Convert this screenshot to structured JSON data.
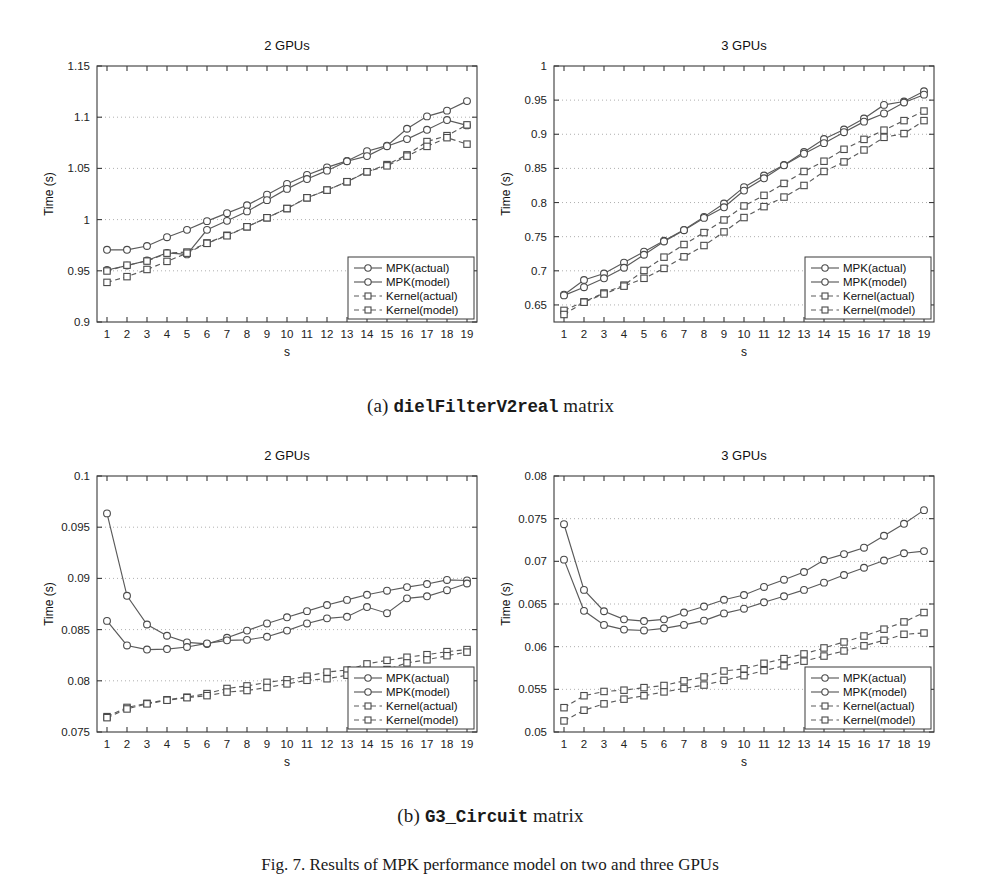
{
  "figure": {
    "caption_a_prefix": "(a) ",
    "caption_a_mono": "dielFilterV2real",
    "caption_a_suffix": " matrix",
    "caption_b_prefix": "(b) ",
    "caption_b_mono": "G3_Circuit",
    "caption_b_suffix": " matrix",
    "figure_caption": "Fig. 7. Results of MPK performance model on two and three GPUs"
  },
  "legend": {
    "entries": [
      {
        "label": "MPK(actual)",
        "marker": "circle",
        "dash": false
      },
      {
        "label": "MPK(model)",
        "marker": "circle",
        "dash": false
      },
      {
        "label": "Kernel(actual)",
        "marker": "square",
        "dash": true
      },
      {
        "label": "Kernel(model)",
        "marker": "square",
        "dash": true
      }
    ]
  },
  "chart_data": [
    {
      "id": "diel-2gpu",
      "type": "line",
      "title": "2 GPUs",
      "xlabel": "s",
      "ylabel": "Time (s)",
      "xlim": [
        0.5,
        19.5
      ],
      "ylim": [
        0.9,
        1.15
      ],
      "yticks": [
        0.9,
        0.95,
        1,
        1.05,
        1.1,
        1.15
      ],
      "yticklabels": [
        "0.9",
        "0.95",
        "1",
        "1.05",
        "1.1",
        "1.15"
      ],
      "x": [
        1,
        2,
        3,
        4,
        5,
        6,
        7,
        8,
        9,
        10,
        11,
        12,
        13,
        14,
        15,
        16,
        17,
        18,
        19
      ],
      "xticklabels": [
        "1",
        "2",
        "3",
        "4",
        "5",
        "6",
        "7",
        "8",
        "9",
        "10",
        "11",
        "12",
        "13",
        "14",
        "15",
        "16",
        "17",
        "18",
        "19"
      ],
      "grid": true,
      "legend_position": "lower-right",
      "series": [
        {
          "name": "MPK(actual)",
          "marker": "circle",
          "dash": false,
          "values": [
            0.9705,
            0.9705,
            0.9742,
            0.9828,
            0.99,
            0.9985,
            1.0063,
            1.014,
            1.0243,
            1.0348,
            1.0436,
            1.051,
            1.0573,
            1.0668,
            1.0722,
            1.0887,
            1.1008,
            1.1064,
            1.1157
          ]
        },
        {
          "name": "MPK(model)",
          "marker": "circle",
          "dash": false,
          "values": [
            0.9508,
            0.9551,
            0.96,
            0.9675,
            0.966,
            0.99,
            0.9988,
            1.008,
            1.019,
            1.03,
            1.0396,
            1.0478,
            1.057,
            1.062,
            1.0717,
            1.0786,
            1.0877,
            1.0972,
            1.092
          ]
        },
        {
          "name": "Kernel(actual)",
          "marker": "square",
          "dash": true,
          "values": [
            0.9498,
            0.9555,
            0.9595,
            0.9672,
            0.9683,
            0.9772,
            0.9847,
            0.993,
            1.0018,
            1.0108,
            1.0213,
            1.0288,
            1.037,
            1.0467,
            1.0537,
            1.0632,
            1.0762,
            1.082,
            1.0925
          ]
        },
        {
          "name": "Kernel(model)",
          "marker": "square",
          "dash": true,
          "values": [
            0.9387,
            0.9443,
            0.9513,
            0.9592,
            0.9672,
            0.9768,
            0.9842,
            0.993,
            1.0018,
            1.0108,
            1.0213,
            1.0288,
            1.037,
            1.0467,
            1.0525,
            1.062,
            1.0715,
            1.08,
            1.0737
          ]
        }
      ]
    },
    {
      "id": "diel-3gpu",
      "type": "line",
      "title": "3 GPUs",
      "xlabel": "s",
      "ylabel": "Time (s)",
      "xlim": [
        0.5,
        19.5
      ],
      "ylim": [
        0.625,
        1.0
      ],
      "yticks": [
        0.65,
        0.7,
        0.75,
        0.8,
        0.85,
        0.9,
        0.95,
        1
      ],
      "yticklabels": [
        "0.65",
        "0.7",
        "0.75",
        "0.8",
        "0.85",
        "0.9",
        "0.95",
        "1"
      ],
      "x": [
        1,
        2,
        3,
        4,
        5,
        6,
        7,
        8,
        9,
        10,
        11,
        12,
        13,
        14,
        15,
        16,
        17,
        18,
        19
      ],
      "xticklabels": [
        "1",
        "2",
        "3",
        "4",
        "5",
        "6",
        "7",
        "8",
        "9",
        "10",
        "11",
        "12",
        "13",
        "14",
        "15",
        "16",
        "17",
        "18",
        "19"
      ],
      "grid": true,
      "legend_position": "lower-right",
      "series": [
        {
          "name": "MPK(actual)",
          "marker": "circle",
          "dash": false,
          "values": [
            0.665,
            0.6865,
            0.696,
            0.712,
            0.728,
            0.744,
            0.76,
            0.779,
            0.7985,
            0.8225,
            0.8395,
            0.855,
            0.874,
            0.893,
            0.907,
            0.923,
            0.943,
            0.948,
            0.963
          ]
        },
        {
          "name": "MPK(model)",
          "marker": "circle",
          "dash": false,
          "values": [
            0.664,
            0.676,
            0.689,
            0.7045,
            0.7235,
            0.743,
            0.7595,
            0.7775,
            0.793,
            0.8175,
            0.8355,
            0.8545,
            0.8715,
            0.887,
            0.903,
            0.9185,
            0.9305,
            0.9465,
            0.958
          ]
        },
        {
          "name": "Kernel(actual)",
          "marker": "square",
          "dash": true,
          "values": [
            0.642,
            0.6545,
            0.6675,
            0.679,
            0.7005,
            0.72,
            0.7385,
            0.756,
            0.7745,
            0.795,
            0.8105,
            0.828,
            0.8455,
            0.8605,
            0.878,
            0.8925,
            0.906,
            0.92,
            0.934
          ]
        },
        {
          "name": "Kernel(model)",
          "marker": "square",
          "dash": true,
          "values": [
            0.636,
            0.654,
            0.666,
            0.6775,
            0.689,
            0.7035,
            0.7205,
            0.737,
            0.757,
            0.778,
            0.794,
            0.808,
            0.825,
            0.8455,
            0.8595,
            0.877,
            0.8955,
            0.901,
            0.92
          ]
        }
      ]
    },
    {
      "id": "g3-2gpu",
      "type": "line",
      "title": "2 GPUs",
      "xlabel": "s",
      "ylabel": "Time (s)",
      "xlim": [
        0.5,
        19.5
      ],
      "ylim": [
        0.075,
        0.1
      ],
      "yticks": [
        0.075,
        0.08,
        0.085,
        0.09,
        0.095,
        0.1
      ],
      "yticklabels": [
        "0.075",
        "0.08",
        "0.085",
        "0.09",
        "0.095",
        "0.1"
      ],
      "x": [
        1,
        2,
        3,
        4,
        5,
        6,
        7,
        8,
        9,
        10,
        11,
        12,
        13,
        14,
        15,
        16,
        17,
        18,
        19
      ],
      "xticklabels": [
        "1",
        "2",
        "3",
        "4",
        "5",
        "6",
        "7",
        "8",
        "9",
        "10",
        "11",
        "12",
        "13",
        "14",
        "15",
        "16",
        "17",
        "18",
        "19"
      ],
      "grid": true,
      "legend_position": "lower-right",
      "series": [
        {
          "name": "MPK(actual)",
          "marker": "circle",
          "dash": false,
          "values": [
            0.09635,
            0.0883,
            0.0855,
            0.0844,
            0.08375,
            0.0836,
            0.0842,
            0.0849,
            0.0856,
            0.0862,
            0.0868,
            0.0874,
            0.0879,
            0.0884,
            0.0888,
            0.08915,
            0.08945,
            0.08985,
            0.0898
          ]
        },
        {
          "name": "MPK(model)",
          "marker": "circle",
          "dash": false,
          "values": [
            0.08585,
            0.08345,
            0.08305,
            0.0831,
            0.0833,
            0.08365,
            0.08395,
            0.084,
            0.0843,
            0.0849,
            0.0856,
            0.0861,
            0.08625,
            0.0872,
            0.0866,
            0.08805,
            0.08825,
            0.08885,
            0.0895
          ]
        },
        {
          "name": "Kernel(actual)",
          "marker": "square",
          "dash": true,
          "values": [
            0.0765,
            0.0774,
            0.0778,
            0.07815,
            0.0784,
            0.07875,
            0.07925,
            0.0795,
            0.07985,
            0.0801,
            0.08045,
            0.08085,
            0.08105,
            0.08165,
            0.082,
            0.0823,
            0.08255,
            0.08285,
            0.08305
          ]
        },
        {
          "name": "Kernel(model)",
          "marker": "square",
          "dash": true,
          "values": [
            0.0764,
            0.07725,
            0.07775,
            0.0781,
            0.07835,
            0.07855,
            0.0789,
            0.07905,
            0.07935,
            0.0797,
            0.08005,
            0.0802,
            0.08055,
            0.08095,
            0.0811,
            0.08175,
            0.08205,
            0.08245,
            0.0828
          ]
        }
      ]
    },
    {
      "id": "g3-3gpu",
      "type": "line",
      "title": "3 GPUs",
      "xlabel": "s",
      "ylabel": "Time (s)",
      "xlim": [
        0.5,
        19.5
      ],
      "ylim": [
        0.05,
        0.08
      ],
      "yticks": [
        0.05,
        0.055,
        0.06,
        0.065,
        0.07,
        0.075,
        0.08
      ],
      "yticklabels": [
        "0.05",
        "0.055",
        "0.06",
        "0.065",
        "0.07",
        "0.075",
        "0.08"
      ],
      "x": [
        1,
        2,
        3,
        4,
        5,
        6,
        7,
        8,
        9,
        10,
        11,
        12,
        13,
        14,
        15,
        16,
        17,
        18,
        19
      ],
      "xticklabels": [
        "1",
        "2",
        "3",
        "4",
        "5",
        "6",
        "7",
        "8",
        "9",
        "10",
        "11",
        "12",
        "13",
        "14",
        "15",
        "16",
        "17",
        "18",
        "19"
      ],
      "grid": true,
      "legend_position": "lower-right",
      "series": [
        {
          "name": "MPK(actual)",
          "marker": "circle",
          "dash": false,
          "values": [
            0.07435,
            0.06665,
            0.06415,
            0.0632,
            0.063,
            0.0632,
            0.064,
            0.0647,
            0.0655,
            0.06605,
            0.067,
            0.06785,
            0.06875,
            0.07015,
            0.07085,
            0.0716,
            0.073,
            0.0744,
            0.076
          ]
        },
        {
          "name": "MPK(model)",
          "marker": "circle",
          "dash": false,
          "values": [
            0.0702,
            0.0642,
            0.06255,
            0.062,
            0.0619,
            0.06215,
            0.06255,
            0.06305,
            0.0639,
            0.06445,
            0.0652,
            0.0659,
            0.06665,
            0.0675,
            0.0684,
            0.06925,
            0.0701,
            0.07095,
            0.0712
          ]
        },
        {
          "name": "Kernel(actual)",
          "marker": "square",
          "dash": true,
          "values": [
            0.05285,
            0.05425,
            0.05475,
            0.0549,
            0.0552,
            0.05545,
            0.056,
            0.05645,
            0.05715,
            0.0574,
            0.05805,
            0.0586,
            0.05915,
            0.05985,
            0.06055,
            0.06125,
            0.06205,
            0.0629,
            0.064
          ]
        },
        {
          "name": "Kernel(model)",
          "marker": "square",
          "dash": true,
          "values": [
            0.0513,
            0.05255,
            0.0533,
            0.05385,
            0.05425,
            0.0547,
            0.0551,
            0.0555,
            0.05605,
            0.0566,
            0.0572,
            0.05775,
            0.0583,
            0.0589,
            0.0595,
            0.0601,
            0.06075,
            0.06145,
            0.0616
          ]
        }
      ]
    }
  ]
}
